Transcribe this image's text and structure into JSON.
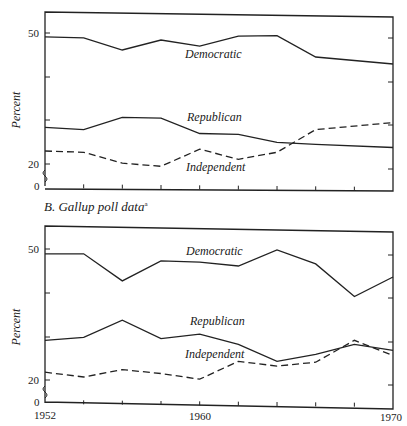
{
  "chart_data": [
    {
      "type": "line",
      "title": "",
      "xlabel": "",
      "ylabel": "Percent",
      "ylim": [
        0,
        55
      ],
      "y_ticks": [
        "0",
        "20",
        "50"
      ],
      "x": [
        1952,
        1954,
        1956,
        1958,
        1960,
        1962,
        1964,
        1966,
        1968,
        1970
      ],
      "series": [
        {
          "name": "Democratic",
          "style": "solid",
          "values": [
            49.1,
            48.9,
            46.1,
            48.4,
            47.0,
            49.3,
            49.4,
            44.5,
            null,
            42.9
          ]
        },
        {
          "name": "Republican",
          "style": "solid",
          "values": [
            28.4,
            27.9,
            30.7,
            30.5,
            27.0,
            26.8,
            25.0,
            24.5,
            null,
            23.8
          ]
        },
        {
          "name": "Independent",
          "style": "dashed",
          "values": [
            23.0,
            22.7,
            20.2,
            19.5,
            23.4,
            21.1,
            22.7,
            27.9,
            null,
            29.5
          ]
        }
      ],
      "grid": false,
      "legend": "inline labels"
    },
    {
      "type": "line",
      "title": "B. Gallup poll data",
      "title_footnote": "a",
      "xlabel": "",
      "ylabel": "Percent",
      "ylim": [
        0,
        55
      ],
      "y_ticks": [
        "0",
        "20",
        "50"
      ],
      "x_tick_labels": [
        "1952",
        "1960",
        "1970"
      ],
      "x": [
        1952,
        1954,
        1956,
        1958,
        1960,
        1962,
        1964,
        1966,
        1968,
        1970
      ],
      "series": [
        {
          "name": "Democratic",
          "style": "solid",
          "values": [
            48.9,
            48.9,
            42.7,
            47.3,
            47.0,
            46.1,
            49.8,
            46.6,
            39.1,
            43.6
          ]
        },
        {
          "name": "Republican",
          "style": "solid",
          "values": [
            29.1,
            29.8,
            33.7,
            29.5,
            30.5,
            28.2,
            24.3,
            25.9,
            28.2,
            26.8
          ]
        },
        {
          "name": "Independent",
          "style": "dashed",
          "values": [
            21.8,
            20.7,
            22.4,
            21.5,
            20.2,
            24.3,
            23.2,
            24.1,
            29.1,
            25.6
          ]
        }
      ],
      "grid": false,
      "legend": "inline labels"
    }
  ],
  "labels": {
    "ylabel": "Percent",
    "caption_b": "B. Gallup poll data",
    "caption_b_note": "a",
    "democratic": "Democratic",
    "republican": "Republican",
    "independent": "Independent",
    "y50": "50",
    "y20": "20",
    "y0": "0",
    "x1952": "1952",
    "x1960": "1960",
    "x1970": "1970"
  }
}
